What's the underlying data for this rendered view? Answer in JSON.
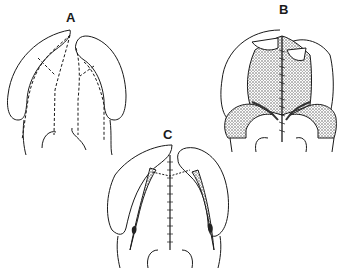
{
  "figure": {
    "panels": [
      {
        "id": "A",
        "label": "A",
        "description": "Incision lines (dashed) on palate between bilateral flaps"
      },
      {
        "id": "B",
        "label": "B",
        "description": "Mucoperiosteal flaps elevated and sutured at midline"
      },
      {
        "id": "C",
        "label": "C",
        "description": "Closed palate with midline suture and lateral relaxing incisions"
      }
    ],
    "colors": {
      "line": "#1a1a1a",
      "background": "#ffffff",
      "stipple": "#555555"
    }
  }
}
